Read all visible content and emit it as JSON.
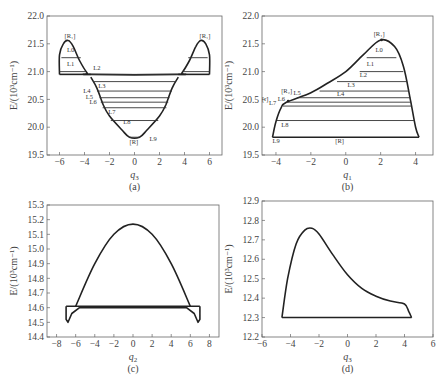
{
  "chart_data": [
    {
      "panel": "a",
      "type": "line",
      "caption": "(a)",
      "xlabel": "q3",
      "ylabel": "E/(10^3 cm^-1)",
      "xlim": [
        -7,
        7
      ],
      "ylim": [
        19.5,
        22.0
      ],
      "xticks": [
        -6,
        -4,
        -2,
        0,
        2,
        4,
        6
      ],
      "yticks": [
        19.5,
        20.0,
        20.5,
        21.0,
        21.5,
        22.0
      ],
      "grid": false,
      "annotations": [
        "[R1]",
        "[R1]",
        "L0",
        "L1",
        "L2",
        "L3",
        "L4",
        "L5",
        "L6",
        "L7",
        "L8",
        "L9",
        "[R]"
      ],
      "curve_points": [
        [
          -6,
          20.95
        ],
        [
          -6,
          21.3
        ],
        [
          -5.7,
          21.5
        ],
        [
          -5.3,
          21.56
        ],
        [
          -4.9,
          21.45
        ],
        [
          -4.4,
          21.2
        ],
        [
          -3.8,
          20.98
        ],
        [
          -3.5,
          20.95
        ],
        [
          3.5,
          20.95
        ],
        [
          3.8,
          20.98
        ],
        [
          4.4,
          21.2
        ],
        [
          4.9,
          21.45
        ],
        [
          5.3,
          21.56
        ],
        [
          5.7,
          21.5
        ],
        [
          6,
          21.3
        ],
        [
          6,
          20.95
        ]
      ],
      "well_points": [
        [
          -3.5,
          20.9
        ],
        [
          -3,
          20.7
        ],
        [
          -2.5,
          20.4
        ],
        [
          -2,
          20.2
        ],
        [
          -1,
          19.95
        ],
        [
          -0.4,
          19.82
        ],
        [
          0.4,
          19.82
        ],
        [
          1,
          19.95
        ],
        [
          2,
          20.2
        ],
        [
          2.5,
          20.4
        ],
        [
          3,
          20.7
        ],
        [
          3.5,
          20.9
        ]
      ],
      "level_lines": [
        21.25,
        21.0,
        20.95,
        20.82,
        20.65,
        20.53,
        20.45,
        20.35,
        20.12,
        19.82
      ]
    },
    {
      "panel": "b",
      "type": "line",
      "caption": "(b)",
      "xlabel": "q1",
      "ylabel": "E/(10^3 cm^-1)",
      "xlim": [
        -4.8,
        5
      ],
      "ylim": [
        19.5,
        22.0
      ],
      "xticks": [
        -4,
        -2,
        0,
        2,
        4
      ],
      "yticks": [
        19.5,
        20.0,
        20.5,
        21.0,
        21.5,
        22.0
      ],
      "grid": false,
      "annotations": [
        "[R1]",
        "[R2]",
        "[r]",
        "L0",
        "L1",
        "L2",
        "L3",
        "L4",
        "L5",
        "L6",
        "L7",
        "L8",
        "L9",
        "[R]"
      ],
      "curve_points": [
        [
          -4.2,
          19.82
        ],
        [
          -4,
          20.1
        ],
        [
          -3.7,
          20.35
        ],
        [
          -3.4,
          20.45
        ],
        [
          -2,
          20.62
        ],
        [
          -1,
          20.8
        ],
        [
          0,
          21.0
        ],
        [
          1,
          21.3
        ],
        [
          2,
          21.57
        ],
        [
          2.8,
          21.45
        ],
        [
          3.3,
          21.1
        ],
        [
          3.7,
          20.5
        ],
        [
          4.0,
          20.0
        ],
        [
          4.2,
          19.82
        ]
      ],
      "level_lines": [
        21.25,
        21.0,
        20.82,
        20.65,
        20.53,
        20.45,
        20.38,
        20.12,
        19.82
      ]
    },
    {
      "panel": "c",
      "type": "line",
      "caption": "(c)",
      "xlabel": "q2",
      "ylabel": "E/(10^3 cm^-1)",
      "xlim": [
        -9,
        9
      ],
      "ylim": [
        14.4,
        15.3
      ],
      "xticks": [
        -8,
        -6,
        -4,
        -2,
        0,
        2,
        4,
        6,
        8
      ],
      "yticks": [
        14.4,
        14.5,
        14.6,
        14.7,
        14.8,
        14.9,
        15.0,
        15.1,
        15.2,
        15.3
      ],
      "grid": false,
      "curve_points": [
        [
          -6,
          14.61
        ],
        [
          -4,
          14.9
        ],
        [
          -2,
          15.1
        ],
        [
          0,
          15.17
        ],
        [
          2,
          15.1
        ],
        [
          4,
          14.9
        ],
        [
          6,
          14.61
        ]
      ],
      "lower_points": [
        [
          -7,
          14.61
        ],
        [
          -7,
          14.52
        ],
        [
          -6.8,
          14.5
        ],
        [
          -6.4,
          14.56
        ],
        [
          -5.6,
          14.6
        ],
        [
          5.6,
          14.6
        ],
        [
          6.4,
          14.56
        ],
        [
          6.8,
          14.5
        ],
        [
          7,
          14.52
        ],
        [
          7,
          14.61
        ]
      ],
      "level_lines": [
        14.61
      ]
    },
    {
      "panel": "d",
      "type": "line",
      "caption": "(d)",
      "xlabel": "q3",
      "ylabel": "E/(10^3 cm^-1)",
      "xlim": [
        -6,
        6
      ],
      "ylim": [
        12.2,
        12.9
      ],
      "xticks": [
        -6,
        -4,
        -2,
        0,
        2,
        4,
        6
      ],
      "yticks": [
        12.2,
        12.3,
        12.4,
        12.5,
        12.6,
        12.7,
        12.8,
        12.9
      ],
      "grid": false,
      "curve_points": [
        [
          -4.6,
          12.3
        ],
        [
          -4.2,
          12.5
        ],
        [
          -3.6,
          12.68
        ],
        [
          -3,
          12.75
        ],
        [
          -2.5,
          12.76
        ],
        [
          -2,
          12.73
        ],
        [
          -1,
          12.62
        ],
        [
          0,
          12.52
        ],
        [
          1,
          12.45
        ],
        [
          2,
          12.41
        ],
        [
          3,
          12.385
        ],
        [
          4,
          12.37
        ],
        [
          4.3,
          12.33
        ],
        [
          4.5,
          12.3
        ]
      ],
      "level_lines": [
        12.3
      ]
    }
  ],
  "labels": {
    "a_caption": "(a)",
    "b_caption": "(b)",
    "c_caption": "(c)",
    "d_caption": "(d)",
    "xlabel_a": "q",
    "xsub_a": "3",
    "xlabel_b": "q",
    "xsub_b": "1",
    "xlabel_c": "q",
    "xsub_c": "2",
    "xlabel_d": "q",
    "xsub_d": "3",
    "ylabel": "E/(10³cm⁻¹)"
  }
}
